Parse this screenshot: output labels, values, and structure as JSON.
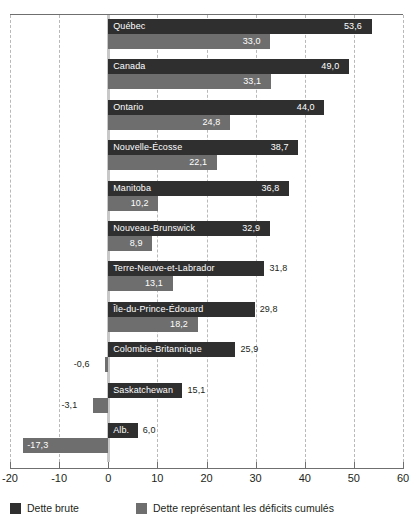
{
  "chart_data": {
    "type": "bar",
    "orientation": "horizontal",
    "title": "",
    "subtitle": "",
    "xlabel": "",
    "ylabel": "",
    "xlim": [
      -20,
      60
    ],
    "xticks": [
      -20,
      -10,
      0,
      10,
      20,
      30,
      40,
      50,
      60
    ],
    "xtick_labels": [
      "-20",
      "-10",
      "0",
      "10",
      "20",
      "30",
      "40",
      "50",
      "60"
    ],
    "grid": "vertical-dashed",
    "legend_position": "bottom-left",
    "categories": [
      "Québec",
      "Canada",
      "Ontario",
      "Nouvelle-Écosse",
      "Manitoba",
      "Nouveau-Brunswick",
      "Terre-Neuve-et-Labrador",
      "Île-du-Prince-Édouard",
      "Colombie-Britannique",
      "Saskatchewan",
      "Alb."
    ],
    "series": [
      {
        "name": "Dette brute",
        "color": "#2f2f2f",
        "values": [
          53.6,
          49.0,
          44.0,
          38.7,
          36.8,
          32.9,
          31.8,
          29.8,
          25.9,
          15.1,
          6.0
        ],
        "labels": [
          "53,6",
          "49,0",
          "44,0",
          "38,7",
          "36,8",
          "32,9",
          "31,8",
          "29,8",
          "25,9",
          "15,1",
          "6,0"
        ]
      },
      {
        "name": "Dette représentant les déficits cumulés",
        "color": "#6e6e6e",
        "values": [
          33.0,
          33.1,
          24.8,
          22.1,
          10.2,
          8.9,
          13.1,
          18.2,
          -0.6,
          -3.1,
          -17.3
        ],
        "labels": [
          "33,0",
          "33,1",
          "24,8",
          "22,1",
          "10,2",
          "8,9",
          "13,1",
          "18,2",
          "-0,6",
          "-3,1",
          "-17,3"
        ]
      }
    ]
  },
  "legend": {
    "items": [
      {
        "label": "Dette brute"
      },
      {
        "label": "Dette représentant les déficits cumulés"
      }
    ]
  }
}
